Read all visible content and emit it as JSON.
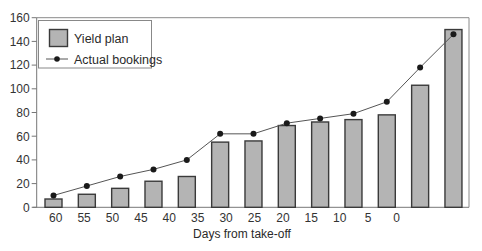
{
  "chart_data": {
    "type": "bar",
    "title": "",
    "xlabel": "Days from take-off",
    "ylabel": "",
    "ylim": [
      0,
      160
    ],
    "yticks": [
      0,
      20,
      40,
      60,
      80,
      100,
      120,
      140,
      160
    ],
    "xtick_labels": [
      "60",
      "55",
      "50",
      "45",
      "40",
      "35",
      "30",
      "25",
      "20",
      "15",
      "10",
      "5",
      "0"
    ],
    "grid": false,
    "legend_position": "upper left",
    "categories": [
      "1",
      "2",
      "3",
      "4",
      "5",
      "6",
      "7",
      "8",
      "9",
      "10",
      "11",
      "12",
      "13"
    ],
    "series": [
      {
        "name": "Yield plan",
        "type": "bar",
        "color": "#b4b4b4",
        "edge_color": "#3a3a3a",
        "values": [
          7,
          11,
          16,
          22,
          26,
          55,
          56,
          69,
          72,
          74,
          78,
          103,
          150
        ]
      },
      {
        "name": "Actual bookings",
        "type": "line",
        "color": "#555555",
        "marker_color": "#1a1a1a",
        "values": [
          10,
          18,
          26,
          32,
          40,
          62,
          62,
          71,
          75,
          79,
          89,
          118,
          146
        ]
      }
    ]
  },
  "legend": {
    "items": [
      {
        "label": "Yield plan"
      },
      {
        "label": "Actual bookings"
      }
    ]
  },
  "axes": {
    "x_title": "Days from take-off"
  }
}
